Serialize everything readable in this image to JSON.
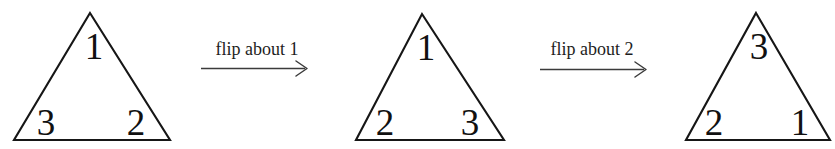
{
  "diagram": {
    "type": "triangle-flip-sequence",
    "background_color": "#ffffff",
    "stroke_color": "#161616",
    "arrow_color": "#3b3b3b",
    "label_color": "#111111",
    "triangles": [
      {
        "id": "triangle-1",
        "name": "initial-triangle",
        "apex_label": "1",
        "bottom_left_label": "3",
        "bottom_right_label": "2"
      },
      {
        "id": "triangle-2",
        "name": "after-first-flip-triangle",
        "apex_label": "1",
        "bottom_left_label": "2",
        "bottom_right_label": "3"
      },
      {
        "id": "triangle-3",
        "name": "after-second-flip-triangle",
        "apex_label": "3",
        "bottom_left_label": "2",
        "bottom_right_label": "1"
      }
    ],
    "arrows": [
      {
        "id": "arrow-1",
        "name": "flip-about-1-arrow",
        "label": "flip about 1"
      },
      {
        "id": "arrow-2",
        "name": "flip-about-2-arrow",
        "label": "flip about 2"
      }
    ]
  }
}
